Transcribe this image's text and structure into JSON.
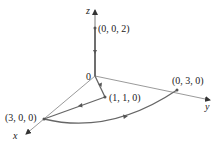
{
  "diagram": {
    "type": "3d-path-diagram",
    "axes": {
      "x_label": "x",
      "y_label": "y",
      "z_label": "z",
      "origin_label": "0"
    },
    "points": [
      {
        "id": "p002",
        "label": "(0, 0, 2)"
      },
      {
        "id": "p030",
        "label": "(0, 3, 0)"
      },
      {
        "id": "p110",
        "label": "(1, 1, 0)"
      },
      {
        "id": "p300",
        "label": "(3, 0, 0)"
      }
    ],
    "path_segments": [
      {
        "from": "(0, 0, 2)",
        "to": "0",
        "kind": "line"
      },
      {
        "from": "0",
        "to": "(1, 1, 0)",
        "kind": "line"
      },
      {
        "from": "(1, 1, 0)",
        "to": "(3, 0, 0)",
        "kind": "line"
      },
      {
        "from": "(3, 0, 0)",
        "to": "(0, 3, 0)",
        "kind": "arc"
      }
    ],
    "colors": {
      "axis": "#555555",
      "path": "#666666",
      "text": "#222222"
    }
  }
}
